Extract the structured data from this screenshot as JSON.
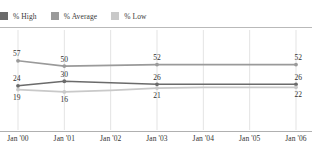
{
  "legend": {
    "position": "top-left",
    "items": [
      {
        "label": "% High",
        "color": "#6b6b6b",
        "swatch_name": "legend-swatch-high"
      },
      {
        "label": "% Average",
        "color": "#9a9a9a",
        "swatch_name": "legend-swatch-average"
      },
      {
        "label": "% Low",
        "color": "#c9c9c9",
        "swatch_name": "legend-swatch-low"
      }
    ]
  },
  "chart_data": {
    "type": "line",
    "title": "",
    "subtitle": "",
    "xlabel": "",
    "ylabel": "",
    "grid": "vertical",
    "legend_position": "top-left",
    "ylim": [
      0,
      66
    ],
    "categories": [
      "Jan '00",
      "Jan '01",
      "Jan '02",
      "Jan '03",
      "Jan '04",
      "Jan '05",
      "Jan '06"
    ],
    "x_tick_labels": [
      "Jan '00",
      "Jan '01",
      "Jan '02",
      "Jan '03",
      "Jan '04",
      "Jan '05",
      "Jan '06"
    ],
    "series": [
      {
        "name": "% Average",
        "color": "#9a9a9a",
        "values": [
          57,
          50,
          51,
          52,
          52,
          52,
          52
        ],
        "labeled_points": [
          {
            "category": "Jan '00",
            "value": 57,
            "label": "57",
            "placement": "above"
          },
          {
            "category": "Jan '01",
            "value": 50,
            "label": "50",
            "placement": "above"
          },
          {
            "category": "Jan '03",
            "value": 52,
            "label": "52",
            "placement": "above"
          },
          {
            "category": "Jan '06",
            "value": 52,
            "label": "52",
            "placement": "above"
          }
        ]
      },
      {
        "name": "% High",
        "color": "#6b6b6b",
        "values": [
          24,
          30,
          28,
          26,
          26,
          26,
          26
        ],
        "labeled_points": [
          {
            "category": "Jan '00",
            "value": 24,
            "label": "24",
            "placement": "above"
          },
          {
            "category": "Jan '01",
            "value": 30,
            "label": "30",
            "placement": "above"
          },
          {
            "category": "Jan '03",
            "value": 26,
            "label": "26",
            "placement": "above"
          },
          {
            "category": "Jan '06",
            "value": 26,
            "label": "26",
            "placement": "above"
          }
        ]
      },
      {
        "name": "% Low",
        "color": "#c9c9c9",
        "values": [
          19,
          16,
          18,
          21,
          22,
          22,
          22
        ],
        "labeled_points": [
          {
            "category": "Jan '00",
            "value": 19,
            "label": "19",
            "placement": "below"
          },
          {
            "category": "Jan '01",
            "value": 16,
            "label": "16",
            "placement": "below"
          },
          {
            "category": "Jan '03",
            "value": 21,
            "label": "21",
            "placement": "below"
          },
          {
            "category": "Jan '06",
            "value": 22,
            "label": "22",
            "placement": "below"
          }
        ]
      }
    ]
  }
}
